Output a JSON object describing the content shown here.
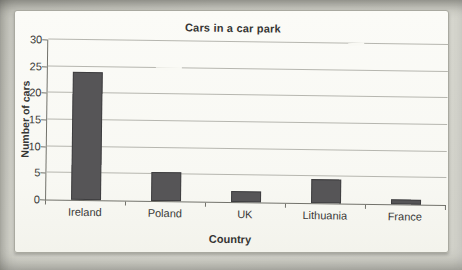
{
  "photo": {
    "paper_color": "#d4d4cc",
    "panel_color": "#f8f8f3"
  },
  "chart_data": {
    "type": "bar",
    "title": "Cars in a car park",
    "xlabel": "Country",
    "ylabel": "Number of cars",
    "categories": [
      "Ireland",
      "Poland",
      "UK",
      "Lithuania",
      "France"
    ],
    "values": [
      24,
      5.5,
      2,
      4.5,
      1
    ],
    "ylim": [
      0,
      30
    ],
    "yticks": [
      0,
      5,
      10,
      15,
      20,
      25,
      30
    ],
    "grid": true,
    "legend": false,
    "bar_color": "#565557",
    "gridline_color": "#b6b6af",
    "axis_color": "#72726b"
  }
}
